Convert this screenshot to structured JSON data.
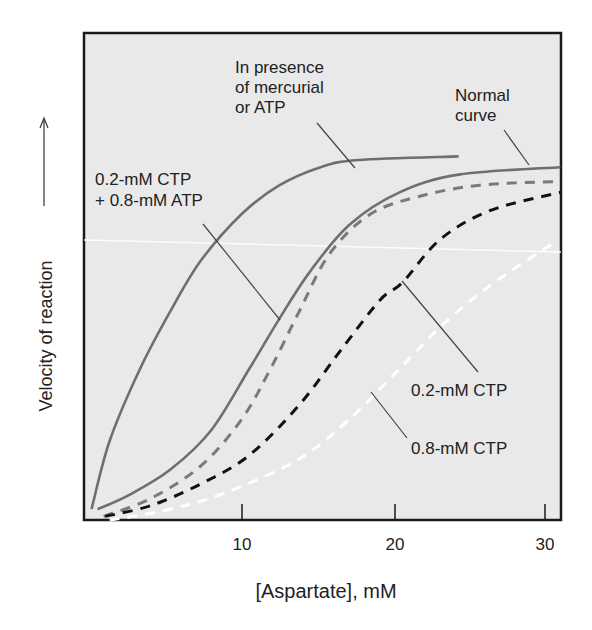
{
  "chart_data": {
    "type": "line",
    "title": "",
    "xlabel": "[Aspartate], mM",
    "ylabel": "Velocity of reaction",
    "ylabel_arrow": true,
    "xlim": [
      0,
      31
    ],
    "ylim": [
      0,
      1.35
    ],
    "x_ticks": [
      10,
      20,
      30
    ],
    "x_tick_labels": [
      "10",
      "20",
      "30"
    ],
    "grid": false,
    "background": "#e9e9e9",
    "series": [
      {
        "name": "In presence of mercurial or ATP",
        "style": "solid",
        "color": "#6f6f6f",
        "x": [
          0.1,
          1.3,
          3.3,
          5.3,
          7.3,
          10.0,
          12.5,
          15.2,
          17.7,
          24.3
        ],
        "y": [
          0.03,
          0.22,
          0.42,
          0.58,
          0.72,
          0.85,
          0.93,
          0.98,
          1.0,
          1.01
        ]
      },
      {
        "name": "Normal curve",
        "style": "solid",
        "color": "#6f6f6f",
        "x": [
          0.5,
          2.6,
          5.3,
          8.0,
          10.5,
          12.5,
          14.5,
          17.1,
          20.4,
          24.4,
          31.0
        ],
        "y": [
          0.03,
          0.07,
          0.14,
          0.25,
          0.42,
          0.56,
          0.69,
          0.82,
          0.91,
          0.96,
          0.98
        ]
      },
      {
        "name": "0.2-mM CTP + 0.8-mM ATP",
        "style": "dashed",
        "color": "#7a7a7a",
        "x": [
          0.9,
          4.0,
          7.3,
          10.0,
          11.9,
          13.8,
          15.8,
          18.5,
          21.8,
          25.7,
          30.6
        ],
        "y": [
          0.01,
          0.06,
          0.15,
          0.28,
          0.42,
          0.58,
          0.74,
          0.85,
          0.9,
          0.93,
          0.94
        ]
      },
      {
        "name": "0.2-mM CTP",
        "style": "dashed",
        "color": "#111111",
        "x": [
          1.0,
          4.0,
          7.3,
          10.5,
          13.8,
          16.5,
          19.1,
          20.6,
          23.1,
          26.4,
          31.0
        ],
        "y": [
          0.01,
          0.04,
          0.1,
          0.18,
          0.32,
          0.47,
          0.61,
          0.66,
          0.78,
          0.86,
          0.91
        ]
      },
      {
        "name": "0.8-mM CTP",
        "style": "dashed",
        "color": "#ffffff",
        "x": [
          1.3,
          5.3,
          9.2,
          13.8,
          17.1,
          20.4,
          23.7,
          27.0,
          30.6
        ],
        "y": [
          0.0,
          0.03,
          0.08,
          0.17,
          0.28,
          0.42,
          0.56,
          0.67,
          0.77
        ]
      }
    ],
    "annotations": [
      {
        "text_lines": [
          "In presence",
          "of mercurial",
          "or ATP"
        ],
        "target": "In presence of mercurial or ATP"
      },
      {
        "text_lines": [
          "Normal",
          "curve"
        ],
        "target": "Normal curve"
      },
      {
        "text_lines": [
          "0.2-mM CTP",
          "+ 0.8-mM ATP"
        ],
        "target": "0.2-mM CTP + 0.8-mM ATP"
      },
      {
        "text_lines": [
          "0.2-mM CTP"
        ],
        "target": "0.2-mM CTP"
      },
      {
        "text_lines": [
          "0.8-mM CTP"
        ],
        "target": "0.8-mM CTP"
      }
    ]
  },
  "labels": {
    "ylabel": "Velocity of reaction",
    "xlabel": "[Aspartate], mM",
    "tick_10": "10",
    "tick_20": "20",
    "tick_30": "30",
    "mercurial_1": "In presence",
    "mercurial_2": "of mercurial",
    "mercurial_3": "or ATP",
    "normal_1": "Normal",
    "normal_2": "curve",
    "ctp_atp_1": "0.2-mM CTP",
    "ctp_atp_2": "+ 0.8-mM ATP",
    "ctp02": "0.2-mM CTP",
    "ctp08": "0.8-mM CTP"
  }
}
